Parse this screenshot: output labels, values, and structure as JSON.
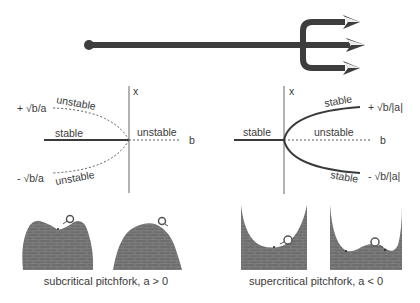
{
  "colors": {
    "ink": "#3a3a3a",
    "trident": "#3d3d3d",
    "wall": "#6e6e6e",
    "brick_line": "#8c8c8c",
    "dashed": "#5a5a5a",
    "background": "#ffffff"
  },
  "trident": {
    "icon": "trident-icon",
    "description": "pitchfork arrow with three tines"
  },
  "subcritical": {
    "axis_x_label": "x",
    "axis_b_label": "b",
    "upper_branch_value": "+ √b/a",
    "lower_branch_value": "- √b/a",
    "upper_branch_label": "unstable",
    "lower_branch_label": "unstable",
    "left_axis_label": "stable",
    "right_axis_label": "unstable",
    "caption": "subcritical pitchfork, a > 0"
  },
  "supercritical": {
    "axis_x_label": "x",
    "axis_b_label": "b",
    "upper_branch_value": "+ √b/|a|",
    "lower_branch_value": "- √b/|a|",
    "upper_branch_label": "stable",
    "lower_branch_label": "stable",
    "left_axis_label": "stable",
    "right_axis_label": "unstable",
    "caption": "supercritical pitchfork, a < 0"
  },
  "landscapes": [
    {
      "name": "subcritical-b-negative",
      "shape": "hill with shallow dip",
      "ball": "on right shoulder"
    },
    {
      "name": "subcritical-b-positive",
      "shape": "single hill",
      "ball": "on top"
    },
    {
      "name": "supercritical-b-negative",
      "shape": "single well",
      "ball": "on right wall"
    },
    {
      "name": "supercritical-b-positive",
      "shape": "double well",
      "ball": "on central bump"
    }
  ]
}
